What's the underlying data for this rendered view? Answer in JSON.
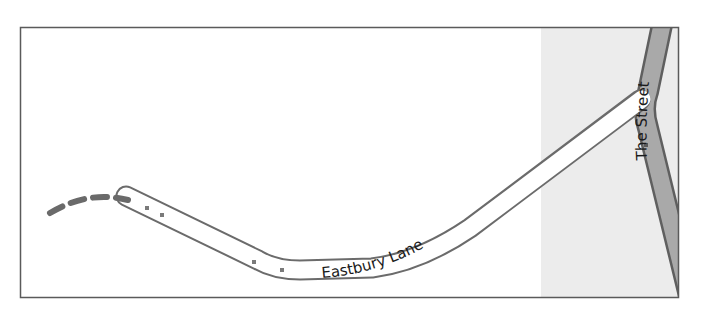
{
  "map": {
    "frame": {
      "x": 20,
      "y": 27,
      "width": 659,
      "height": 271,
      "border_color": "#5a5a5a",
      "background": "#ffffff"
    },
    "landuse_area": {
      "type": "grey-area",
      "x_start": 541,
      "color": "#ececec"
    },
    "roads": [
      {
        "name": "Eastbury Lane",
        "type": "minor-road",
        "fill_color": "#ffffff",
        "casing_color": "#6b6b6b",
        "label": "Eastbury Lane"
      },
      {
        "name": "The Street",
        "type": "secondary-road",
        "fill_color": "#a9a9a9",
        "casing_color": "#6b6b6b",
        "label": "The Street"
      },
      {
        "name": "footpath",
        "type": "dashed-path",
        "color": "#6a6a6a"
      }
    ],
    "colors": {
      "road_casing": "#6b6b6b",
      "secondary_fill": "#a9a9a9",
      "node_marker": "#7a7a7a",
      "label_text": "#1a1a1a"
    }
  }
}
